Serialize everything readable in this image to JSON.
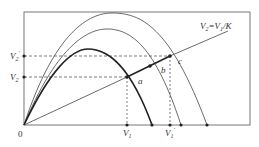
{
  "diagram": {
    "line_label": "V2=V1/K",
    "line_label_parts": {
      "a": "V",
      "a_sub": "2",
      "eq": "=V",
      "b_sub": "1",
      "tail": "/K"
    },
    "origin_label": "0",
    "y_labels": [
      {
        "id": "V2_prime",
        "base": "V",
        "sub": "2",
        "prime": "′"
      },
      {
        "id": "V2",
        "base": "V",
        "sub": "2",
        "prime": ""
      }
    ],
    "x_labels": [
      {
        "id": "V1",
        "base": "V",
        "sub": "1",
        "prime": ""
      },
      {
        "id": "V1_prime",
        "base": "V",
        "sub": "1",
        "prime": "′"
      }
    ],
    "points": [
      {
        "label": "a"
      },
      {
        "label": "b"
      },
      {
        "label": "c"
      }
    ],
    "curves": [
      {
        "name": "inner-curve",
        "emphasis": "bold"
      },
      {
        "name": "middle-curve",
        "emphasis": "normal"
      },
      {
        "name": "outer-curve",
        "emphasis": "normal"
      }
    ],
    "colors": {
      "stroke": "#333333",
      "background": "#ffffff"
    }
  }
}
